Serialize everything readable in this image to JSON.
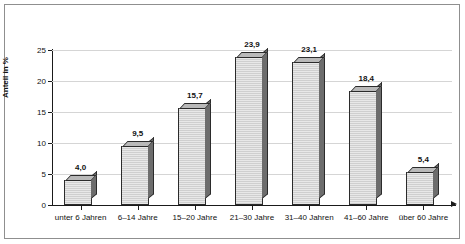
{
  "chart_data": {
    "type": "bar",
    "title": "",
    "subtitle": "",
    "xlabel": "",
    "ylabel": "Anteil in %",
    "ylim": [
      0,
      25
    ],
    "yticks": [
      "0",
      "5",
      "10",
      "15",
      "20",
      "25"
    ],
    "ytick_values": [
      0,
      5,
      10,
      15,
      20,
      25
    ],
    "grid": true,
    "legend": "none",
    "categories": [
      "unter 6 Jahren",
      "6–14 Jahre",
      "15–20 Jahre",
      "21–30 Jahre",
      "31–40 Jahren",
      "41–60 Jahre",
      "über 60 Jahre"
    ],
    "values": [
      4.0,
      9.5,
      15.7,
      23.9,
      23.1,
      18.4,
      5.4
    ],
    "value_labels": [
      "4,0",
      "9,5",
      "15,7",
      "23,9",
      "23,1",
      "18,4",
      "5,4"
    ],
    "colors": {
      "bar_face": "#dcdcdc",
      "bar_side": "#6d6d6d",
      "bar_top": "#b9b9b9",
      "bar_outline": "#2b2b2b",
      "gridline": "#d5d5d5",
      "axis": "#1a1a1a",
      "frame": "#8f8f8f",
      "background": "#ffffff",
      "text": "#111111"
    }
  }
}
